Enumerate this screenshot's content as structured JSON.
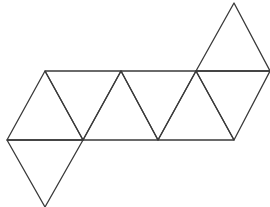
{
  "diagram": {
    "stroke_color": "#3a3a3a",
    "background": "#ffffff",
    "face_count": 8,
    "vertices": {
      "A": [
        234,
        3
      ],
      "T1": [
        45,
        71
      ],
      "T2": [
        121,
        71
      ],
      "T3": [
        196,
        71
      ],
      "T4": [
        270,
        71
      ],
      "B1": [
        7,
        140
      ],
      "B2": [
        83,
        140
      ],
      "B3": [
        158,
        140
      ],
      "B4": [
        234,
        140
      ],
      "C": [
        45,
        207
      ]
    },
    "faces": [
      {
        "id": "face-1",
        "points": "45,71 7,140 83,140"
      },
      {
        "id": "face-2",
        "points": "45,71 121,71 83,140"
      },
      {
        "id": "face-3",
        "points": "121,71 83,140 158,140"
      },
      {
        "id": "face-4",
        "points": "121,71 196,71 158,140"
      },
      {
        "id": "face-5",
        "points": "196,71 158,140 234,140"
      },
      {
        "id": "face-6",
        "points": "196,71 270,71 234,140"
      },
      {
        "id": "face-7",
        "points": "234,3 196,71 270,71"
      },
      {
        "id": "face-8",
        "points": "7,140 83,140 45,207"
      }
    ]
  }
}
